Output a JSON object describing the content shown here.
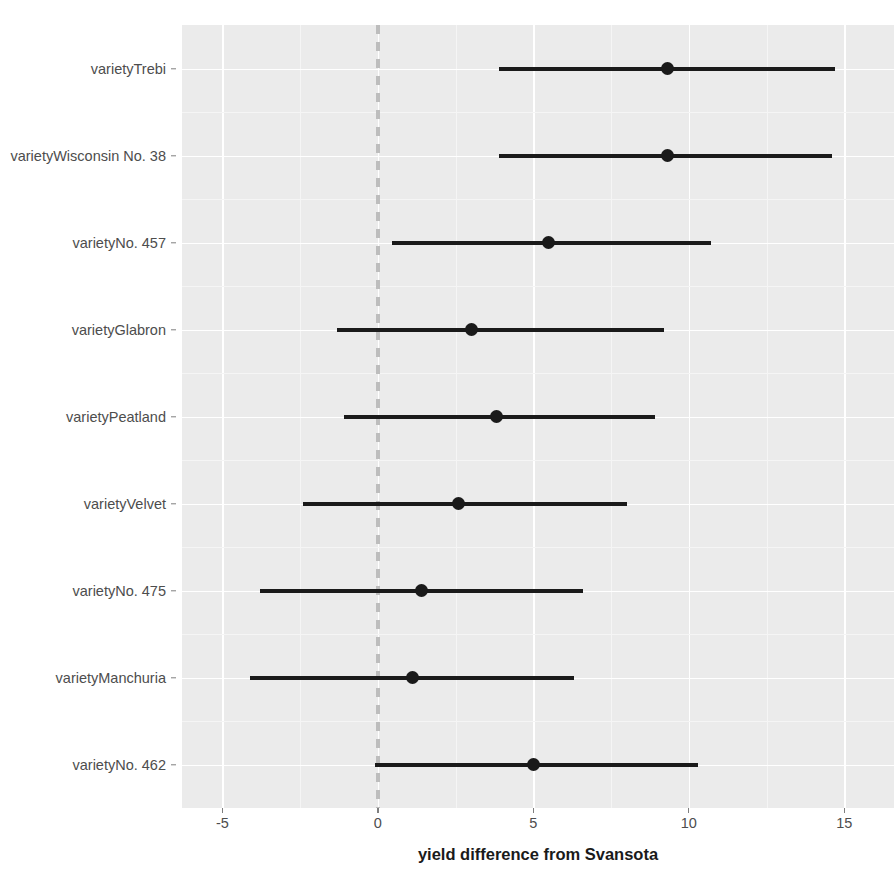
{
  "chart_data": {
    "type": "scatter",
    "title": "",
    "subtitle": "",
    "xlabel": "yield difference from Svansota",
    "ylabel": "",
    "xlim": [
      -6.3,
      16.6
    ],
    "x_ticks": [
      -5,
      0,
      5,
      10,
      15
    ],
    "x_tick_labels": [
      "-5",
      "0",
      "5",
      "10",
      "15"
    ],
    "grid": true,
    "legend": "none",
    "annotations": [
      {
        "name": "zero-reference-line",
        "value": 0,
        "style": "dashed",
        "color": "#bdbdbd"
      }
    ],
    "plot_style": "forest-plot coefficient estimates with confidence intervals",
    "categories": [
      "varietyTrebi",
      "varietyWisconsin No. 38",
      "varietyNo. 457",
      "varietyGlabron",
      "varietyPeatland",
      "varietyVelvet",
      "varietyNo. 475",
      "varietyManchuria",
      "varietyNo. 462"
    ],
    "series": [
      {
        "name": "estimate",
        "values": [
          9.3,
          9.3,
          5.5,
          3.0,
          2.6,
          2.6,
          1.4,
          1.1,
          5.0
        ]
      },
      {
        "name": "ci_low",
        "values": [
          3.9,
          3.9,
          0.45,
          -1.3,
          -1.1,
          -2.4,
          -3.8,
          -4.1,
          -0.1
        ]
      },
      {
        "name": "ci_high",
        "values": [
          14.7,
          14.6,
          10.7,
          9.2,
          8.9,
          8.0,
          6.6,
          6.3,
          10.3
        ]
      }
    ],
    "points": [
      {
        "label": "varietyTrebi",
        "estimate": 9.3,
        "ci_low": 3.9,
        "ci_high": 14.7
      },
      {
        "label": "varietyWisconsin No. 38",
        "estimate": 9.3,
        "ci_low": 3.9,
        "ci_high": 14.6
      },
      {
        "label": "varietyNo. 457",
        "estimate": 5.5,
        "ci_low": 0.45,
        "ci_high": 10.7
      },
      {
        "label": "varietyGlabron",
        "estimate": 3.0,
        "ci_low": -1.3,
        "ci_high": 9.2
      },
      {
        "label": "varietyPeatland",
        "estimate": 3.8,
        "ci_low": -1.1,
        "ci_high": 8.9
      },
      {
        "label": "varietyVelvet",
        "estimate": 2.6,
        "ci_low": -2.4,
        "ci_high": 8.0
      },
      {
        "label": "varietyNo. 475",
        "estimate": 1.4,
        "ci_low": -3.8,
        "ci_high": 6.6
      },
      {
        "label": "varietyManchuria",
        "estimate": 1.1,
        "ci_low": -4.1,
        "ci_high": 6.3
      },
      {
        "label": "varietyNo. 462",
        "estimate": 5.0,
        "ci_low": -0.1,
        "ci_high": 10.3
      }
    ],
    "colors": {
      "panel_background": "#ebebeb",
      "major_gridline": "#ffffff",
      "minor_gridline": "#f5f5f5",
      "point_and_line": "#1a1a1a",
      "zero_line": "#bdbdbd",
      "axis_text": "#4d4d4d",
      "axis_title": "#1a1a1a",
      "figure_background": "#ffffff"
    }
  }
}
